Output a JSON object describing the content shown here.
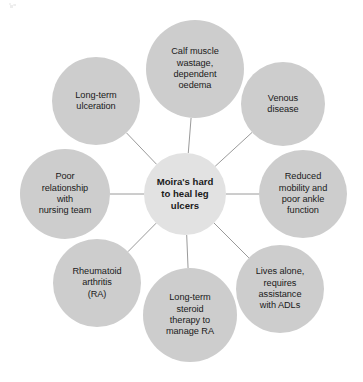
{
  "diagram": {
    "type": "radial-mind-map",
    "center": {
      "id": "center",
      "label": "Moira's hard\nto heal leg\nulcers",
      "cx": 185,
      "cy": 194,
      "r": 41,
      "fill": "#e2e2e2"
    },
    "edge_color": "#9a9a9a",
    "nodes": [
      {
        "id": "calf-muscle-wastage",
        "label": "Calf muscle\nwastage,\ndependent\noedema",
        "cx": 195,
        "cy": 69,
        "r": 49,
        "fill": "#cdcdcd"
      },
      {
        "id": "venous-disease",
        "label": "Venous\ndisease",
        "cx": 283,
        "cy": 104,
        "r": 42,
        "fill": "#cdcdcd"
      },
      {
        "id": "reduced-mobility",
        "label": "Reduced\nmobility and\npoor ankle\nfunction",
        "cx": 303,
        "cy": 194,
        "r": 44,
        "fill": "#cdcdcd"
      },
      {
        "id": "lives-alone",
        "label": "Lives alone,\nrequires\nassistance\nwith ADLs",
        "cx": 280,
        "cy": 289,
        "r": 44,
        "fill": "#cdcdcd"
      },
      {
        "id": "steroid-therapy",
        "label": "Long-term\nsteroid\ntherapy to\nmanage RA",
        "cx": 190,
        "cy": 315,
        "r": 47,
        "fill": "#cdcdcd"
      },
      {
        "id": "rheumatoid-arthritis",
        "label": "Rheumatoid\narthritis\n(RA)",
        "cx": 97,
        "cy": 283,
        "r": 44,
        "fill": "#cdcdcd"
      },
      {
        "id": "poor-relationship",
        "label": "Poor\nrelationship\nwith\nnursing team",
        "cx": 65,
        "cy": 194,
        "r": 45,
        "fill": "#cdcdcd"
      },
      {
        "id": "long-term-ulceration",
        "label": "Long-term\nulceration",
        "cx": 96,
        "cy": 101,
        "r": 44,
        "fill": "#cdcdcd"
      }
    ],
    "edges": [
      {
        "from": "center",
        "to": "calf-muscle-wastage"
      },
      {
        "from": "center",
        "to": "venous-disease"
      },
      {
        "from": "center",
        "to": "reduced-mobility"
      },
      {
        "from": "center",
        "to": "lives-alone"
      },
      {
        "from": "center",
        "to": "steroid-therapy"
      },
      {
        "from": "center",
        "to": "rheumatoid-arthritis"
      },
      {
        "from": "center",
        "to": "poor-relationship"
      },
      {
        "from": "center",
        "to": "long-term-ulceration"
      }
    ]
  }
}
